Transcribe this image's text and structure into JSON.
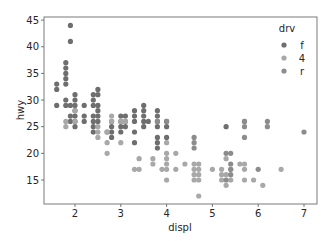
{
  "chart_data": {
    "type": "scatter",
    "title": "",
    "xlabel": "displ",
    "ylabel": "hwy",
    "xlim": [
      1.35,
      7.3
    ],
    "ylim": [
      10.4,
      45.6
    ],
    "xticks": [
      2,
      3,
      4,
      5,
      6,
      7
    ],
    "yticks": [
      15,
      20,
      25,
      30,
      35,
      40,
      45
    ],
    "grid": false,
    "legend": {
      "title": "drv",
      "position": "upper right",
      "entries": [
        {
          "label": "f",
          "color": "#6e6e6e"
        },
        {
          "label": "4",
          "color": "#a8a8a8"
        },
        {
          "label": "r",
          "color": "#8c8c8c"
        }
      ]
    },
    "series": [
      {
        "name": "f",
        "color": "#6e6e6e",
        "points": [
          [
            1.6,
            33
          ],
          [
            1.6,
            32
          ],
          [
            1.6,
            29
          ],
          [
            1.8,
            29
          ],
          [
            1.8,
            30
          ],
          [
            1.8,
            33
          ],
          [
            1.8,
            34
          ],
          [
            1.8,
            35
          ],
          [
            1.8,
            36
          ],
          [
            1.8,
            37
          ],
          [
            1.9,
            44
          ],
          [
            1.9,
            41
          ],
          [
            1.9,
            29
          ],
          [
            1.9,
            27
          ],
          [
            1.9,
            26
          ],
          [
            2.0,
            31
          ],
          [
            2.0,
            30
          ],
          [
            2.0,
            29
          ],
          [
            2.0,
            28
          ],
          [
            2.0,
            27
          ],
          [
            2.0,
            26
          ],
          [
            2.0,
            25
          ],
          [
            2.2,
            29
          ],
          [
            2.2,
            27
          ],
          [
            2.2,
            26
          ],
          [
            2.4,
            31
          ],
          [
            2.4,
            30
          ],
          [
            2.4,
            29
          ],
          [
            2.4,
            27
          ],
          [
            2.4,
            26
          ],
          [
            2.4,
            25
          ],
          [
            2.4,
            24
          ],
          [
            2.5,
            32
          ],
          [
            2.5,
            31
          ],
          [
            2.5,
            29
          ],
          [
            2.5,
            28
          ],
          [
            2.5,
            27
          ],
          [
            2.5,
            26
          ],
          [
            2.7,
            24
          ],
          [
            2.8,
            26
          ],
          [
            2.8,
            25
          ],
          [
            2.8,
            24
          ],
          [
            2.8,
            23
          ],
          [
            3.0,
            26
          ],
          [
            3.0,
            25
          ],
          [
            3.0,
            24
          ],
          [
            3.0,
            27
          ],
          [
            3.1,
            27
          ],
          [
            3.1,
            26
          ],
          [
            3.1,
            25
          ],
          [
            3.3,
            28
          ],
          [
            3.3,
            27
          ],
          [
            3.3,
            26
          ],
          [
            3.3,
            24
          ],
          [
            3.3,
            22
          ],
          [
            3.5,
            29
          ],
          [
            3.5,
            28
          ],
          [
            3.5,
            27
          ],
          [
            3.5,
            26
          ],
          [
            3.5,
            25
          ],
          [
            3.6,
            26
          ],
          [
            3.8,
            28
          ],
          [
            3.8,
            27
          ],
          [
            3.8,
            26
          ],
          [
            3.8,
            25
          ],
          [
            3.8,
            23
          ],
          [
            3.8,
            22
          ],
          [
            3.8,
            21
          ],
          [
            4.0,
            23
          ],
          [
            4.0,
            25
          ],
          [
            4.0,
            26
          ],
          [
            5.3,
            25
          ]
        ]
      },
      {
        "name": "4",
        "color": "#a8a8a8",
        "points": [
          [
            1.8,
            26
          ],
          [
            1.8,
            25
          ],
          [
            2.0,
            28
          ],
          [
            2.0,
            26
          ],
          [
            2.5,
            25
          ],
          [
            2.5,
            23
          ],
          [
            2.5,
            24
          ],
          [
            2.7,
            24
          ],
          [
            2.7,
            22
          ],
          [
            2.7,
            20
          ],
          [
            2.8,
            27
          ],
          [
            2.8,
            26
          ],
          [
            3.0,
            22
          ],
          [
            3.0,
            26
          ],
          [
            3.1,
            26
          ],
          [
            3.4,
            19
          ],
          [
            3.3,
            17
          ],
          [
            3.4,
            17
          ],
          [
            3.7,
            19
          ],
          [
            3.7,
            18
          ],
          [
            3.9,
            17
          ],
          [
            4.0,
            22
          ],
          [
            4.0,
            20
          ],
          [
            4.0,
            19
          ],
          [
            4.0,
            18
          ],
          [
            4.0,
            17
          ],
          [
            4.0,
            15
          ],
          [
            4.2,
            20
          ],
          [
            4.2,
            17
          ],
          [
            4.4,
            18
          ],
          [
            4.6,
            18
          ],
          [
            4.6,
            17
          ],
          [
            4.6,
            16
          ],
          [
            4.6,
            15
          ],
          [
            4.7,
            18
          ],
          [
            4.7,
            17
          ],
          [
            4.7,
            16
          ],
          [
            4.7,
            15
          ],
          [
            4.7,
            12
          ],
          [
            5.0,
            17
          ],
          [
            5.2,
            17
          ],
          [
            5.2,
            16
          ],
          [
            5.2,
            15
          ],
          [
            5.3,
            16
          ],
          [
            5.3,
            14
          ],
          [
            5.3,
            19
          ],
          [
            5.4,
            17
          ],
          [
            5.4,
            15
          ],
          [
            5.6,
            18
          ],
          [
            5.7,
            17
          ],
          [
            5.7,
            15
          ],
          [
            5.7,
            18
          ],
          [
            5.9,
            15
          ],
          [
            6.1,
            14
          ],
          [
            6.5,
            17
          ]
        ]
      },
      {
        "name": "r",
        "color": "#8c8c8c",
        "points": [
          [
            3.8,
            26
          ],
          [
            4.0,
            26
          ],
          [
            4.6,
            23
          ],
          [
            4.6,
            22
          ],
          [
            4.6,
            21
          ],
          [
            5.3,
            20
          ],
          [
            5.4,
            20
          ],
          [
            5.4,
            18
          ],
          [
            5.4,
            17
          ],
          [
            5.4,
            16
          ],
          [
            5.3,
            15
          ],
          [
            5.7,
            25
          ],
          [
            5.7,
            23
          ],
          [
            5.7,
            26
          ],
          [
            6.0,
            17
          ],
          [
            6.2,
            26
          ],
          [
            6.2,
            25
          ],
          [
            7.0,
            24
          ],
          [
            5.7,
            26
          ]
        ]
      }
    ]
  }
}
